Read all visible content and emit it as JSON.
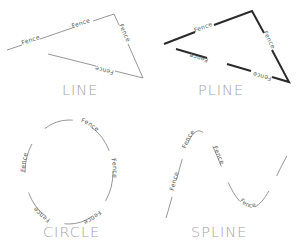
{
  "diagram": {
    "linetype_text": "Fence",
    "panels": [
      {
        "id": "line",
        "label": "LINE",
        "kind": "line segments",
        "weight": "thin"
      },
      {
        "id": "pline",
        "label": "PLINE",
        "kind": "polyline",
        "weight": "thick"
      },
      {
        "id": "circle",
        "label": "CIRCLE",
        "kind": "circle",
        "weight": "thin"
      },
      {
        "id": "spline",
        "label": "SPLINE",
        "kind": "spline",
        "weight": "thin"
      }
    ],
    "colors": {
      "background": "#ffffff",
      "thin_stroke": "#8a8a8a",
      "thick_stroke": "#2a2a2a",
      "label_text": "#a3a3a3",
      "fence_text": "#555555"
    }
  }
}
